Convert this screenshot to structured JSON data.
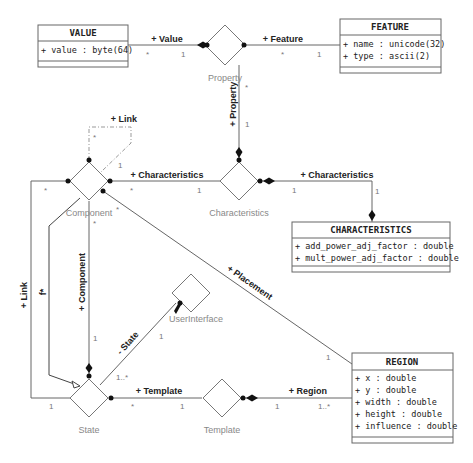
{
  "classes": {
    "value": {
      "name": "VALUE",
      "attrs": [
        "+ value : byte(64)"
      ]
    },
    "feature": {
      "name": "FEATURE",
      "attrs": [
        "+ name : unicode(32)",
        "+ type : ascii(2)"
      ]
    },
    "characteristics": {
      "name": "CHARACTERISTICS",
      "attrs": [
        "+ add_power_adj_factor : double",
        "+ mult_power_adj_factor : double"
      ]
    },
    "region": {
      "name": "REGION",
      "attrs": [
        "+ x : double",
        "+ y : double",
        "+ width : double",
        "+ height : double",
        "+ influence : double"
      ]
    }
  },
  "associations": {
    "property": "Property",
    "characteristics": "Characteristics",
    "component": "Component",
    "user_interface": "UserInterface",
    "state": "State",
    "template": "Template"
  },
  "roles": {
    "value": "+ Value",
    "feature": "+ Feature",
    "property": "+ Property",
    "link_self": "+ Link",
    "characteristics_left": "+ Characteristics",
    "characteristics_right": "+ Characteristics",
    "link_left": "+ Link",
    "f": "f*",
    "component": "+ Component",
    "placement": "+ Placement",
    "state": "- State",
    "template": "+ Template",
    "region": "+ Region"
  },
  "multiplicities": {
    "value_star": "*",
    "value_one": "1",
    "feature_star": "*",
    "feature_one": "1",
    "property_star": "*",
    "property_one": "1",
    "link_star": "*",
    "link_one": "1",
    "comp_char_star": "*",
    "comp_char_one": "1",
    "char_class_one_a": "1",
    "char_class_one_b": "1",
    "comp_left_star": "*",
    "comp_bottom_star": "*",
    "comp_diag_star": "*",
    "component_one": "1",
    "placement_one": "1",
    "ui_one": "1",
    "state_ui": "1..*",
    "state_left_one": "1",
    "template_star": "*",
    "template_one": "1",
    "region_one": "1",
    "region_many": "1..*"
  }
}
